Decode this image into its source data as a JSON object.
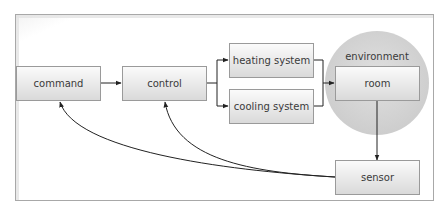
{
  "diagram": {
    "nodes": {
      "command": "command",
      "control": "control",
      "heating": "heating system",
      "cooling": "cooling system",
      "room": "room",
      "sensor": "sensor"
    },
    "groups": {
      "environment": "environment"
    },
    "edges": [
      {
        "from": "command",
        "to": "control",
        "style": "straight"
      },
      {
        "from": "control",
        "to": "heating",
        "style": "elbow"
      },
      {
        "from": "control",
        "to": "cooling",
        "style": "elbow"
      },
      {
        "from": "heating",
        "to": "room",
        "style": "elbow"
      },
      {
        "from": "cooling",
        "to": "room",
        "style": "elbow"
      },
      {
        "from": "room",
        "to": "sensor",
        "style": "straight"
      },
      {
        "from": "sensor",
        "to": "control",
        "style": "curve"
      },
      {
        "from": "sensor",
        "to": "command",
        "style": "curve"
      }
    ],
    "colors": {
      "box_top": "#fafafa",
      "box_bottom": "#dcdcdc",
      "box_border": "#9a9a9a",
      "environment_fill": "#d4d4d4",
      "frame_border": "#a8a8a8",
      "line": "#222222",
      "text": "#3a3a3a"
    }
  }
}
